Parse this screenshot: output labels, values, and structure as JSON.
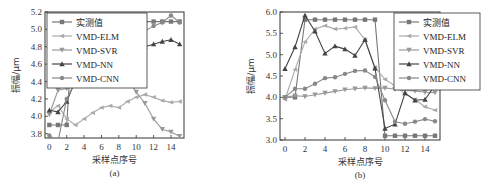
{
  "chart_data": [
    {
      "type": "line",
      "panel": "(a)",
      "xlabel": "采样点序号",
      "ylabel": "振幅/μm",
      "ylim": [
        3.75,
        5.2
      ],
      "xlim": [
        -0.5,
        15.5
      ],
      "yticks": [
        3.8,
        4.0,
        4.2,
        4.4,
        4.6,
        4.8,
        5.0,
        5.2
      ],
      "xticks": [
        0,
        2,
        4,
        6,
        8,
        10,
        12,
        14
      ],
      "grid": false,
      "legend_position": "upper left",
      "x": [
        0,
        1,
        2,
        3,
        4,
        5,
        6,
        7,
        8,
        9,
        10,
        11,
        12,
        13,
        14,
        15
      ],
      "series": [
        {
          "name": "实测值",
          "color": "#777777",
          "marker": "square",
          "values": [
            3.9,
            3.9,
            3.9,
            5.5,
            5.6,
            4.93,
            4.93,
            4.93,
            4.93,
            4.93,
            4.92,
            5.09,
            5.09,
            5.09,
            5.09,
            5.09
          ]
        },
        {
          "name": "VMD-ELM",
          "color": "#aaaaaa",
          "marker": "triangle-left",
          "values": [
            4.05,
            4.12,
            3.97,
            3.9,
            3.97,
            4.04,
            4.1,
            4.12,
            4.1,
            4.17,
            4.22,
            4.25,
            4.22,
            4.18,
            4.16,
            4.17
          ]
        },
        {
          "name": "VMD-SVR",
          "color": "#999999",
          "marker": "triangle-down",
          "values": [
            4.02,
            4.3,
            4.32,
            4.35,
            4.48,
            4.52,
            4.53,
            4.54,
            4.45,
            4.43,
            4.28,
            4.15,
            3.97,
            3.85,
            3.82,
            3.77
          ]
        },
        {
          "name": "VMD-NN",
          "color": "#444444",
          "marker": "triangle-up",
          "values": [
            4.07,
            4.05,
            4.17,
            4.41,
            4.5,
            4.53,
            4.57,
            4.64,
            4.69,
            4.74,
            4.82,
            4.8,
            4.83,
            4.86,
            4.88,
            4.83
          ]
        },
        {
          "name": "VMD-CNN",
          "color": "#888888",
          "marker": "star",
          "values": [
            3.78,
            3.71,
            4.2,
            4.4,
            4.48,
            4.52,
            4.93,
            4.93,
            5.0,
            4.95,
            4.92,
            4.98,
            5.04,
            5.08,
            5.16,
            5.08
          ]
        }
      ]
    },
    {
      "type": "line",
      "panel": "(b)",
      "xlabel": "采样点序号",
      "ylabel": "振幅/μm",
      "ylim": [
        3.0,
        6.0
      ],
      "xlim": [
        -0.5,
        15.5
      ],
      "yticks": [
        3.0,
        3.5,
        4.0,
        4.5,
        5.0,
        5.5,
        6.0
      ],
      "xticks": [
        0,
        2,
        4,
        6,
        8,
        10,
        12,
        14
      ],
      "grid": false,
      "legend_position": "upper right",
      "x": [
        0,
        1,
        2,
        3,
        4,
        5,
        6,
        7,
        8,
        9,
        10,
        11,
        12,
        13,
        14,
        15
      ],
      "series": [
        {
          "name": "实测值",
          "color": "#777777",
          "marker": "square",
          "values": [
            4.0,
            4.0,
            5.82,
            5.82,
            5.82,
            5.82,
            5.82,
            5.82,
            5.82,
            5.82,
            3.1,
            3.1,
            3.1,
            3.1,
            3.1,
            3.1
          ]
        },
        {
          "name": "VMD-ELM",
          "color": "#aaaaaa",
          "marker": "triangle-left",
          "values": [
            3.95,
            4.65,
            5.3,
            5.6,
            5.68,
            5.6,
            5.62,
            5.65,
            5.35,
            4.7,
            4.42,
            4.27,
            4.08,
            3.95,
            3.78,
            3.7
          ]
        },
        {
          "name": "VMD-SVR",
          "color": "#999999",
          "marker": "triangle-down",
          "values": [
            4.0,
            4.04,
            4.02,
            4.06,
            4.1,
            4.14,
            4.18,
            4.2,
            4.22,
            4.21,
            4.22,
            4.19,
            4.16,
            4.15,
            4.12,
            4.11
          ]
        },
        {
          "name": "VMD-NN",
          "color": "#444444",
          "marker": "triangle-up",
          "values": [
            4.67,
            5.18,
            5.92,
            5.55,
            5.03,
            5.2,
            5.13,
            4.98,
            5.35,
            4.68,
            3.27,
            3.37,
            4.1,
            3.93,
            3.95,
            4.28
          ]
        },
        {
          "name": "VMD-CNN",
          "color": "#888888",
          "marker": "star",
          "values": [
            4.0,
            4.2,
            4.2,
            4.32,
            4.45,
            4.47,
            4.55,
            4.62,
            4.63,
            4.48,
            3.93,
            3.43,
            3.38,
            3.43,
            3.49,
            3.44
          ]
        }
      ]
    }
  ]
}
